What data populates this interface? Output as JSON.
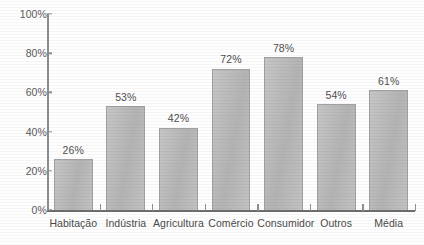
{
  "chart_data": {
    "type": "bar",
    "title": "",
    "subtitle": "",
    "xlabel": "",
    "ylabel": "",
    "categories": [
      "Habitação",
      "Indústria",
      "Agricultura",
      "Comércio",
      "Consumidor",
      "Outros",
      "Média"
    ],
    "values": [
      26,
      53,
      42,
      72,
      78,
      54,
      61
    ],
    "value_labels": [
      "26%",
      "53%",
      "42%",
      "72%",
      "78%",
      "54%",
      "61%"
    ],
    "ylim": [
      0,
      100
    ],
    "y_ticks": [
      0,
      20,
      40,
      60,
      80,
      100
    ],
    "y_tick_labels": [
      "0%",
      "20%",
      "40%",
      "60%",
      "80%",
      "100%"
    ],
    "grid": false,
    "legend": false,
    "legend_position": "none",
    "bar_fill_color": "#b9b9b9",
    "bar_edge_color": "#a0a0a0",
    "axis_color": "#8d8d8d",
    "text_color": "#4a4a4a",
    "background_color": "#ffffff"
  }
}
